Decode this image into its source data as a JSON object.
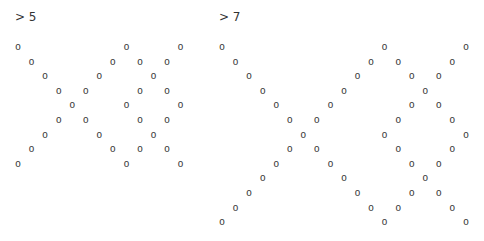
{
  "outputs": [
    {
      "prompt": "> 5",
      "n": 5,
      "char": "o",
      "rows": [
        [
          0,
          8,
          12
        ],
        [
          1,
          7,
          9,
          11
        ],
        [
          2,
          6,
          10
        ],
        [
          3,
          5,
          9,
          11
        ],
        [
          4,
          8,
          12
        ],
        [
          3,
          5,
          9,
          11
        ],
        [
          2,
          6,
          10
        ],
        [
          1,
          7,
          9,
          11
        ],
        [
          0,
          8,
          12
        ]
      ]
    },
    {
      "prompt": "> 7",
      "n": 7,
      "char": "o",
      "rows": [
        [
          0,
          12,
          18
        ],
        [
          1,
          11,
          13,
          17
        ],
        [
          2,
          10,
          14,
          16
        ],
        [
          3,
          9,
          15
        ],
        [
          4,
          8,
          14,
          16
        ],
        [
          5,
          7,
          13,
          17
        ],
        [
          6,
          12,
          18
        ],
        [
          5,
          7,
          13,
          17
        ],
        [
          4,
          8,
          14,
          16
        ],
        [
          3,
          9,
          15
        ],
        [
          2,
          10,
          14,
          16
        ],
        [
          1,
          11,
          13,
          17
        ],
        [
          0,
          12,
          18
        ]
      ]
    }
  ]
}
